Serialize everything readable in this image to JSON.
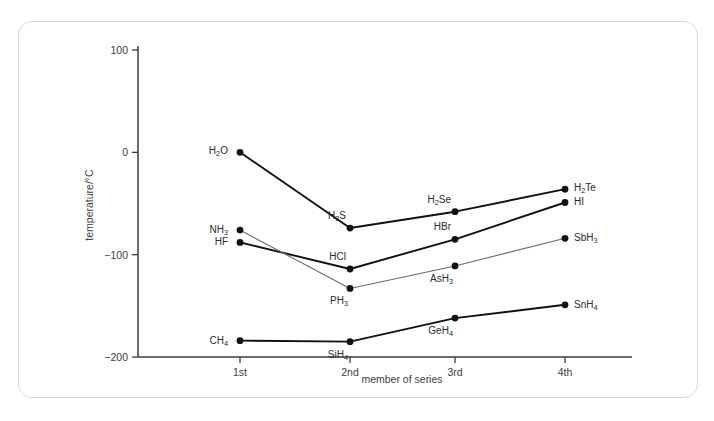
{
  "figure": {
    "top_cut_text": "",
    "bottom_caption": ""
  },
  "chart_data": {
    "type": "line",
    "title": "",
    "xlabel": "member of series",
    "ylabel": "temperature/°C",
    "categories": [
      "1st",
      "2nd",
      "3rd",
      "4th"
    ],
    "x_tick_labels": [
      "1st",
      "2nd",
      "3rd",
      "4th"
    ],
    "y_tick_labels": [
      "100",
      "0",
      "−100",
      "−200"
    ],
    "y_tick_values": [
      100,
      0,
      -100,
      -200
    ],
    "ylim": [
      -200,
      100
    ],
    "xlim": [
      0.4,
      4.35
    ],
    "grid": false,
    "legend": false,
    "legend_position": "none",
    "series": [
      {
        "name": "group 16 hydrides",
        "style": "thick",
        "values": [
          0,
          -74,
          -58,
          -36
        ],
        "point_labels": [
          "H₂O",
          "H₂S",
          "H₂Se",
          "H₂Te"
        ],
        "points": [
          {
            "formula_main": "H",
            "formula_sub": "2",
            "formula_tail": "O",
            "label": "H₂O",
            "x_cat": "1st",
            "y": 0
          },
          {
            "formula_main": "H",
            "formula_sub": "2",
            "formula_tail": "S",
            "label": "H₂S",
            "x_cat": "2nd",
            "y": -74
          },
          {
            "formula_main": "H",
            "formula_sub": "2",
            "formula_tail": "Se",
            "label": "H₂Se",
            "x_cat": "3rd",
            "y": -58
          },
          {
            "formula_main": "H",
            "formula_sub": "2",
            "formula_tail": "Te",
            "label": "H₂Te",
            "x_cat": "4th",
            "y": -36
          }
        ]
      },
      {
        "name": "group 17 hydrides",
        "style": "thick",
        "values": [
          -88,
          -114,
          -85,
          -49
        ],
        "point_labels": [
          "HF",
          "HCl",
          "HBr",
          "HI"
        ],
        "points": [
          {
            "formula_main": "HF",
            "formula_sub": "",
            "formula_tail": "",
            "label": "HF",
            "x_cat": "1st",
            "y": -88
          },
          {
            "formula_main": "HCl",
            "formula_sub": "",
            "formula_tail": "",
            "label": "HCl",
            "x_cat": "2nd",
            "y": -114
          },
          {
            "formula_main": "HBr",
            "formula_sub": "",
            "formula_tail": "",
            "label": "HBr",
            "x_cat": "3rd",
            "y": -85
          },
          {
            "formula_main": "HI",
            "formula_sub": "",
            "formula_tail": "",
            "label": "HI",
            "x_cat": "4th",
            "y": -49
          }
        ]
      },
      {
        "name": "group 15 hydrides",
        "style": "thin",
        "values": [
          -76,
          -133,
          -111,
          -84
        ],
        "point_labels": [
          "NH₃",
          "PH₃",
          "AsH₃",
          "SbH₃"
        ],
        "points": [
          {
            "formula_main": "NH",
            "formula_sub": "3",
            "formula_tail": "",
            "label": "NH₃",
            "x_cat": "1st",
            "y": -76
          },
          {
            "formula_main": "PH",
            "formula_sub": "3",
            "formula_tail": "",
            "label": "PH₃",
            "x_cat": "2nd",
            "y": -133
          },
          {
            "formula_main": "AsH",
            "formula_sub": "3",
            "formula_tail": "",
            "label": "AsH₃",
            "x_cat": "3rd",
            "y": -111
          },
          {
            "formula_main": "SbH",
            "formula_sub": "3",
            "formula_tail": "",
            "label": "SbH₃",
            "x_cat": "4th",
            "y": -84
          }
        ]
      },
      {
        "name": "group 14 hydrides",
        "style": "thick",
        "values": [
          -184,
          -185,
          -162,
          -149
        ],
        "point_labels": [
          "CH₄",
          "SiH₄",
          "GeH₄",
          "SnH₄"
        ],
        "points": [
          {
            "formula_main": "CH",
            "formula_sub": "4",
            "formula_tail": "",
            "label": "CH₄",
            "x_cat": "1st",
            "y": -184
          },
          {
            "formula_main": "SiH",
            "formula_sub": "4",
            "formula_tail": "",
            "label": "SiH₄",
            "x_cat": "2nd",
            "y": -185
          },
          {
            "formula_main": "GeH",
            "formula_sub": "4",
            "formula_tail": "",
            "label": "GeH₄",
            "x_cat": "3rd",
            "y": -162
          },
          {
            "formula_main": "SnH",
            "formula_sub": "4",
            "formula_tail": "",
            "label": "SnH₄",
            "x_cat": "4th",
            "y": -149
          }
        ]
      }
    ]
  }
}
